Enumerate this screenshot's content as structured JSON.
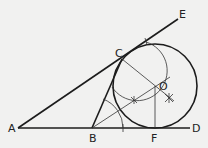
{
  "diagram": {
    "points": {
      "A": {
        "label": "A",
        "x": 18,
        "y": 128
      },
      "B": {
        "label": "B",
        "x": 92,
        "y": 128
      },
      "C": {
        "label": "C",
        "x": 122,
        "y": 59
      },
      "D": {
        "label": "D",
        "x": 190,
        "y": 128
      },
      "E": {
        "label": "E",
        "x": 178,
        "y": 19
      },
      "F": {
        "label": "F",
        "x": 155,
        "y": 128
      },
      "O": {
        "label": "O",
        "x": 155,
        "y": 86
      }
    },
    "circle": {
      "center": "O",
      "radius": 42
    },
    "colors": {
      "stroke": "#1c1c1c",
      "background": "#f1f1f0"
    }
  }
}
